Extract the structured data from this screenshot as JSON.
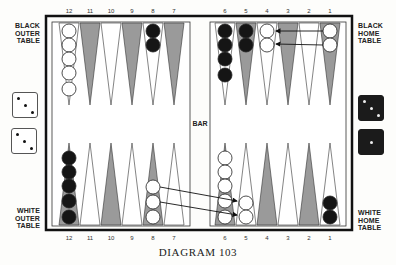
{
  "diagram": {
    "caption": "DIAGRAM 103",
    "bar_label": "BAR",
    "labels": {
      "black_outer": [
        "BLACK",
        "OUTER",
        "TABLE"
      ],
      "black_home": [
        "BLACK",
        "HOME",
        "TABLE"
      ],
      "white_outer": [
        "WHITE",
        "OUTER",
        "TABLE"
      ],
      "white_home": [
        "WHITE",
        "HOME",
        "TABLE"
      ]
    },
    "top_point_numbers": [
      "12",
      "11",
      "10",
      "9",
      "8",
      "7",
      "6",
      "5",
      "4",
      "3",
      "2",
      "1"
    ],
    "bottom_point_numbers": [
      "12",
      "11",
      "10",
      "9",
      "8",
      "7",
      "6",
      "5",
      "4",
      "3",
      "2",
      "1"
    ],
    "colors": {
      "frame": "#111111",
      "dark_point": "#9a9a9a",
      "light_point": "#ffffff",
      "black_checker": "#151515",
      "white_checker": "#ffffff"
    },
    "dice": {
      "white": [
        3,
        3
      ],
      "black": [
        3,
        1
      ]
    },
    "position": {
      "top": [
        {
          "point": "12",
          "color": "white",
          "count": 5
        },
        {
          "point": "8",
          "color": "black",
          "count": 2
        },
        {
          "point": "6",
          "color": "black",
          "count": 4
        },
        {
          "point": "5",
          "color": "black",
          "count": 2
        },
        {
          "point": "4",
          "color": "white",
          "count": 2
        },
        {
          "point": "1",
          "color": "white",
          "count": 2
        }
      ],
      "bottom": [
        {
          "point": "12",
          "color": "black",
          "count": 5
        },
        {
          "point": "8",
          "color": "white",
          "count": 3
        },
        {
          "point": "6",
          "color": "white",
          "count": 5
        },
        {
          "point": "5",
          "color": "white",
          "count": 2
        },
        {
          "point": "1",
          "color": "black",
          "count": 2
        }
      ]
    },
    "moves": [
      {
        "side": "top",
        "from": "1",
        "to": "4"
      },
      {
        "side": "top",
        "from": "1",
        "to": "4"
      },
      {
        "side": "bottom",
        "from": "8",
        "to": "5"
      },
      {
        "side": "bottom",
        "from": "8",
        "to": "5"
      }
    ]
  }
}
